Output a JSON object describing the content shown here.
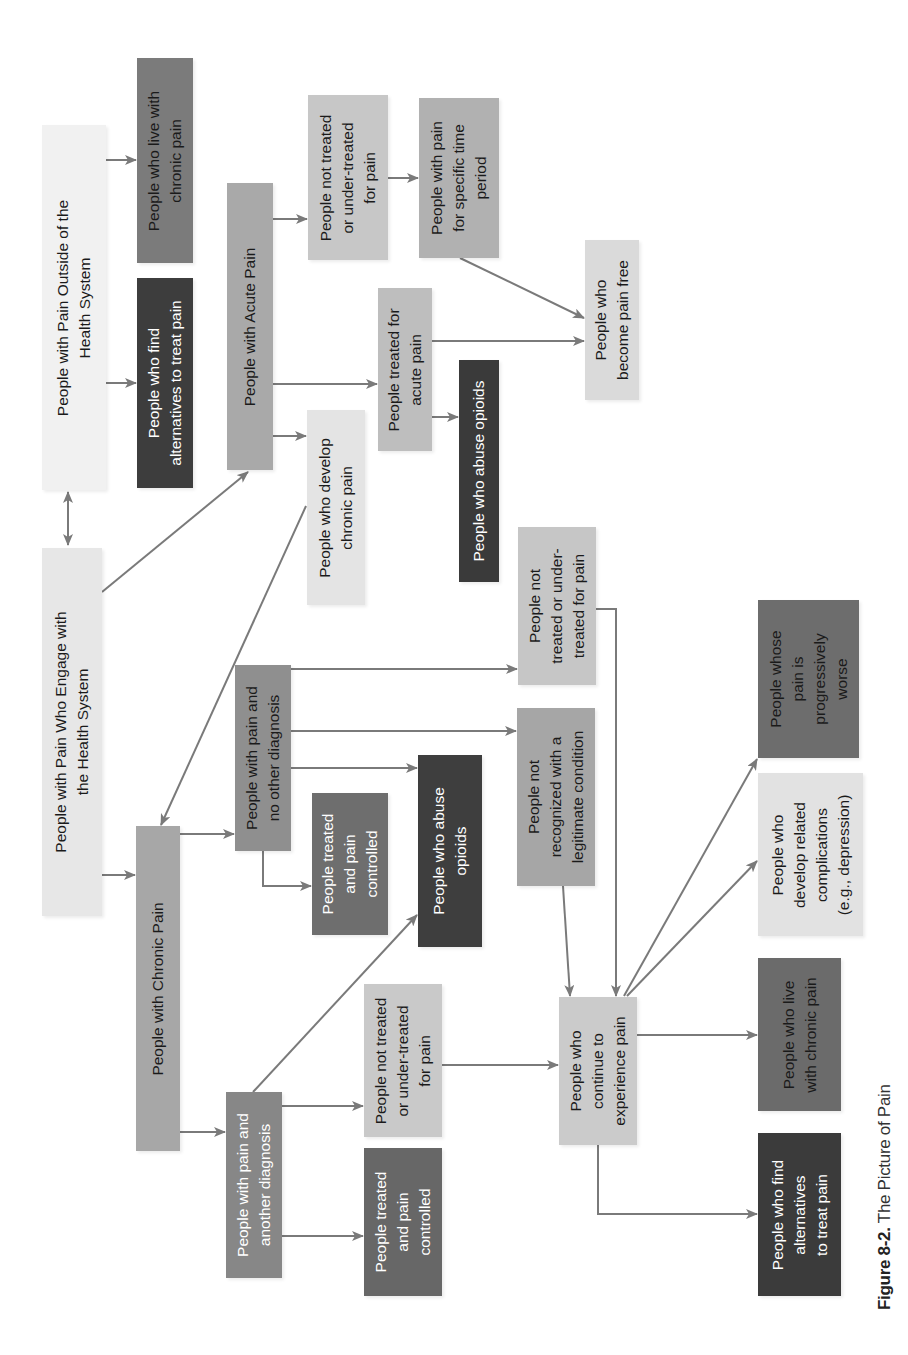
{
  "diagram": {
    "orientation": "rotated-90-ccw",
    "caption": {
      "label": "Figure 8-2.",
      "title": "The Picture of Pain"
    },
    "nodes": [
      {
        "id": "outside",
        "text": "People with Pain Outside of the\nHealth System",
        "x": 42,
        "y": 125,
        "w": 64,
        "h": 365,
        "fill": "#f1f1f1",
        "tone": "light"
      },
      {
        "id": "outside_live",
        "text": "People who live with\nchronic pain",
        "x": 137,
        "y": 58,
        "w": 56,
        "h": 205,
        "fill": "#7b7b7b",
        "tone": "light"
      },
      {
        "id": "outside_alt",
        "text": "People who find\nalternatives to treat pain",
        "x": 137,
        "y": 278,
        "w": 56,
        "h": 210,
        "fill": "#3d3d3d",
        "tone": "dark"
      },
      {
        "id": "acute",
        "text": "People with Acute Pain",
        "x": 227,
        "y": 183,
        "w": 46,
        "h": 287,
        "fill": "#a9a9a9",
        "tone": "light"
      },
      {
        "id": "acute_not_treated",
        "text": "People not treated\nor under-treated\nfor pain",
        "x": 308,
        "y": 95,
        "w": 80,
        "h": 165,
        "fill": "#c7c7c7",
        "tone": "light"
      },
      {
        "id": "acute_specific",
        "text": "People with pain\nfor specific time\nperiod",
        "x": 419,
        "y": 98,
        "w": 80,
        "h": 160,
        "fill": "#b1b1b1",
        "tone": "light"
      },
      {
        "id": "acute_treated",
        "text": "People treated for\nacute pain",
        "x": 378,
        "y": 288,
        "w": 54,
        "h": 163,
        "fill": "#bebebe",
        "tone": "light"
      },
      {
        "id": "acute_opioids",
        "text": "People who abuse opioids",
        "x": 459,
        "y": 360,
        "w": 40,
        "h": 222,
        "fill": "#3a3a3a",
        "tone": "dark"
      },
      {
        "id": "pain_free",
        "text": "People who\nbecome pain free",
        "x": 585,
        "y": 240,
        "w": 54,
        "h": 160,
        "fill": "#dadada",
        "tone": "light"
      },
      {
        "id": "develop_chronic",
        "text": "People who develop\nchronic pain",
        "x": 307,
        "y": 410,
        "w": 58,
        "h": 195,
        "fill": "#e4e4e4",
        "tone": "light"
      },
      {
        "id": "engage",
        "text": "People with Pain Who Engage with\nthe Health System",
        "x": 42,
        "y": 548,
        "w": 60,
        "h": 368,
        "fill": "#e7e7e7",
        "tone": "light"
      },
      {
        "id": "chronic",
        "text": "People with Chronic Pain",
        "x": 136,
        "y": 826,
        "w": 44,
        "h": 325,
        "fill": "#a7a7a7",
        "tone": "light"
      },
      {
        "id": "no_other_dx",
        "text": "People with pain and\nno other diagnosis",
        "x": 235,
        "y": 665,
        "w": 56,
        "h": 186,
        "fill": "#8f8f8f",
        "tone": "light"
      },
      {
        "id": "nodx_controlled",
        "text": "People treated\nand pain\ncontrolled",
        "x": 312,
        "y": 793,
        "w": 76,
        "h": 142,
        "fill": "#6e6e6e",
        "tone": "dark"
      },
      {
        "id": "nodx_opioids",
        "text": "People who abuse\nopioids",
        "x": 418,
        "y": 755,
        "w": 64,
        "h": 192,
        "fill": "#3e3e3e",
        "tone": "dark"
      },
      {
        "id": "not_recognized",
        "text": "People not\nrecognized with a\nlegitimate condition",
        "x": 517,
        "y": 708,
        "w": 78,
        "h": 178,
        "fill": "#a6a6a6",
        "tone": "light"
      },
      {
        "id": "nodx_not_treated",
        "text": "People not\ntreated or under-\ntreated for pain",
        "x": 518,
        "y": 527,
        "w": 78,
        "h": 158,
        "fill": "#c6c6c6",
        "tone": "light"
      },
      {
        "id": "another_dx",
        "text": "People with pain and\nanother diagnosis",
        "x": 226,
        "y": 1092,
        "w": 56,
        "h": 186,
        "fill": "#878787",
        "tone": "dark"
      },
      {
        "id": "adx_not_treated",
        "text": "People not treated\nor under-treated\nfor pain",
        "x": 364,
        "y": 984,
        "w": 78,
        "h": 153,
        "fill": "#c9c9c9",
        "tone": "light"
      },
      {
        "id": "adx_controlled",
        "text": "People treated\nand pain\ncontrolled",
        "x": 364,
        "y": 1148,
        "w": 78,
        "h": 148,
        "fill": "#676767",
        "tone": "dark"
      },
      {
        "id": "continue",
        "text": "People who\ncontinue to\nexperience pain",
        "x": 559,
        "y": 997,
        "w": 78,
        "h": 148,
        "fill": "#cbcbcb",
        "tone": "light"
      },
      {
        "id": "live_chronic",
        "text": "People who live\nwith chronic pain",
        "x": 758,
        "y": 958,
        "w": 83,
        "h": 153,
        "fill": "#6b6b6b",
        "tone": "light"
      },
      {
        "id": "find_alt",
        "text": "People who find\nalternatives\nto treat pain",
        "x": 758,
        "y": 1133,
        "w": 83,
        "h": 163,
        "fill": "#3b3b3b",
        "tone": "dark"
      },
      {
        "id": "complications",
        "text": "People who\ndevelop related\ncomplications\n(e.g., depression)",
        "x": 758,
        "y": 773,
        "w": 105,
        "h": 163,
        "fill": "#e2e2e2",
        "tone": "light"
      },
      {
        "id": "worse",
        "text": "People whose\npain is\nprogressively\nworse",
        "x": 758,
        "y": 600,
        "w": 101,
        "h": 158,
        "fill": "#6d6d6d",
        "tone": "light"
      }
    ],
    "edges": [
      {
        "from": "engage",
        "to": "outside",
        "type": "bidirectional",
        "points": [
          [
            68,
            492
          ],
          [
            68,
            545
          ]
        ]
      },
      {
        "from": "outside",
        "to": "outside_live",
        "points": [
          [
            102,
            160
          ],
          [
            136,
            160
          ]
        ]
      },
      {
        "from": "outside",
        "to": "outside_alt",
        "points": [
          [
            102,
            383
          ],
          [
            136,
            383
          ]
        ]
      },
      {
        "from": "engage",
        "to": "acute",
        "points": [
          [
            102,
            592
          ],
          [
            248,
            472
          ]
        ]
      },
      {
        "from": "engage",
        "to": "chronic",
        "points": [
          [
            102,
            875
          ],
          [
            135,
            875
          ]
        ]
      },
      {
        "from": "acute",
        "to": "acute_not_treated",
        "points": [
          [
            273,
            219
          ],
          [
            307,
            219
          ]
        ]
      },
      {
        "from": "acute",
        "to": "acute_treated",
        "points": [
          [
            273,
            384
          ],
          [
            377,
            384
          ]
        ]
      },
      {
        "from": "acute",
        "to": "develop_chronic",
        "points": [
          [
            273,
            436
          ],
          [
            306,
            436
          ]
        ]
      },
      {
        "from": "acute_not_treated",
        "to": "acute_specific",
        "points": [
          [
            388,
            178
          ],
          [
            418,
            178
          ]
        ]
      },
      {
        "from": "acute_specific",
        "to": "pain_free",
        "points": [
          [
            460,
            258
          ],
          [
            584,
            318
          ]
        ]
      },
      {
        "from": "acute_treated",
        "to": "pain_free",
        "points": [
          [
            432,
            341
          ],
          [
            584,
            341
          ]
        ]
      },
      {
        "from": "acute_treated",
        "to": "acute_opioids",
        "points": [
          [
            432,
            417
          ],
          [
            458,
            417
          ]
        ]
      },
      {
        "from": "develop_chronic",
        "to": "chronic",
        "points": [
          [
            306,
            506
          ],
          [
            161,
            825
          ]
        ]
      },
      {
        "from": "chronic",
        "to": "no_other_dx",
        "points": [
          [
            180,
            834
          ],
          [
            234,
            834
          ]
        ]
      },
      {
        "from": "chronic",
        "to": "another_dx",
        "points": [
          [
            180,
            1132
          ],
          [
            225,
            1132
          ]
        ]
      },
      {
        "from": "no_other_dx",
        "to": "nodx_controlled",
        "points": [
          [
            263,
            851
          ],
          [
            263,
            886
          ],
          [
            311,
            886
          ]
        ]
      },
      {
        "from": "no_other_dx",
        "to": "nodx_opioids",
        "points": [
          [
            291,
            768
          ],
          [
            417,
            768
          ]
        ]
      },
      {
        "from": "no_other_dx",
        "to": "not_recognized",
        "points": [
          [
            291,
            731
          ],
          [
            516,
            731
          ]
        ]
      },
      {
        "from": "no_other_dx",
        "to": "nodx_not_treated",
        "points": [
          [
            291,
            669
          ],
          [
            517,
            669
          ]
        ]
      },
      {
        "from": "another_dx",
        "to": "nodx_opioids",
        "points": [
          [
            253,
            1092
          ],
          [
            417,
            915
          ]
        ]
      },
      {
        "from": "another_dx",
        "to": "adx_not_treated",
        "points": [
          [
            282,
            1106
          ],
          [
            363,
            1106
          ]
        ]
      },
      {
        "from": "another_dx",
        "to": "adx_controlled",
        "points": [
          [
            282,
            1236
          ],
          [
            363,
            1236
          ]
        ]
      },
      {
        "from": "adx_not_treated",
        "to": "continue",
        "points": [
          [
            442,
            1065
          ],
          [
            558,
            1065
          ]
        ]
      },
      {
        "from": "not_recognized",
        "to": "continue",
        "points": [
          [
            563,
            886
          ],
          [
            570,
            996
          ]
        ]
      },
      {
        "from": "nodx_not_treated",
        "to": "continue",
        "points": [
          [
            596,
            609
          ],
          [
            616,
            609
          ],
          [
            616,
            996
          ]
        ]
      },
      {
        "from": "continue",
        "to": "live_chronic",
        "points": [
          [
            637,
            1035
          ],
          [
            757,
            1035
          ]
        ]
      },
      {
        "from": "continue",
        "to": "find_alt",
        "points": [
          [
            598,
            1145
          ],
          [
            598,
            1214
          ],
          [
            757,
            1214
          ]
        ]
      },
      {
        "from": "continue",
        "to": "complications",
        "points": [
          [
            627,
            996
          ],
          [
            757,
            861
          ]
        ]
      },
      {
        "from": "continue",
        "to": "worse",
        "points": [
          [
            624,
            996
          ],
          [
            757,
            759
          ]
        ]
      }
    ],
    "colors": {
      "arrow": "#7a7a7a",
      "background": "#ffffff"
    }
  }
}
